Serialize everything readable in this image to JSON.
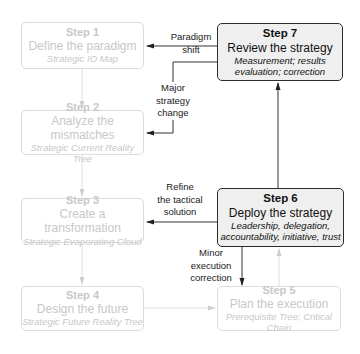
{
  "diagram": {
    "steps": [
      {
        "step": "Step 1",
        "title": "Define the paradigm",
        "subtitle": "Strategic IO Map",
        "state": "faded"
      },
      {
        "step": "Step 2",
        "title": "Analyze the mismatches",
        "subtitle": "Strategic Current Reality Tree",
        "state": "faded"
      },
      {
        "step": "Step 3",
        "title": "Create a transformation",
        "subtitle": "Strategic Evaporating Cloud",
        "state": "faded"
      },
      {
        "step": "Step 4",
        "title": "Design the future",
        "subtitle": "Strategic Future Reality Tree",
        "state": "faded"
      },
      {
        "step": "Step 5",
        "title": "Plan the execution",
        "subtitle": "Prerequisite Tree; Critical Chain",
        "state": "faded"
      },
      {
        "step": "Step 6",
        "title": "Deploy the strategy",
        "subtitle_line1": "Leadership, delegation,",
        "subtitle_line2": "accountability, initiative, trust",
        "state": "active"
      },
      {
        "step": "Step 7",
        "title": "Review the strategy",
        "subtitle_line1": "Measurement; results",
        "subtitle_line2": "evaluation; correction",
        "state": "active"
      }
    ],
    "feedback_labels": {
      "paradigm_shift": {
        "line1": "Paradigm",
        "line2": "shift"
      },
      "major_strategy_change": {
        "line1": "Major",
        "line2": "strategy",
        "line3": "change"
      },
      "refine_tactical": {
        "line1": "Refine",
        "line2": "the tactical",
        "line3": "solution"
      },
      "minor_execution": {
        "line1": "Minor",
        "line2": "execution",
        "line3": "correction"
      }
    },
    "colors": {
      "active_border": "#2b2b2b",
      "active_fill": "#efefef",
      "faded_border": "#dcdcdc",
      "faded_text": "#c8c8c8",
      "arrow_dark": "#333333",
      "arrow_faded": "#d8d8d8"
    }
  }
}
